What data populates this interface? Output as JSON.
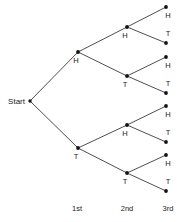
{
  "chart_data": {
    "type": "diagram",
    "diagram_type": "probability-tree",
    "title": "",
    "xlabel": "",
    "ylabel": "",
    "start_label": "Start",
    "stage_labels": [
      "1st",
      "2nd",
      "3rd"
    ],
    "outcome_symbols": [
      "H",
      "T"
    ],
    "nodes": [
      {
        "id": "start",
        "label": "Start",
        "stage": 0,
        "x": 30,
        "y": 101,
        "label_x": 25,
        "label_y": 104,
        "label_anchor": "end"
      },
      {
        "id": "h",
        "label": "H",
        "stage": 1,
        "x": 78,
        "y": 52,
        "label_x": 76,
        "label_y": 63,
        "label_anchor": "middle"
      },
      {
        "id": "t",
        "label": "T",
        "stage": 1,
        "x": 78,
        "y": 148,
        "label_x": 76,
        "label_y": 159,
        "label_anchor": "middle"
      },
      {
        "id": "hh",
        "label": "H",
        "stage": 2,
        "x": 127,
        "y": 27,
        "label_x": 125,
        "label_y": 38,
        "label_anchor": "middle"
      },
      {
        "id": "ht",
        "label": "T",
        "stage": 2,
        "x": 127,
        "y": 76,
        "label_x": 125,
        "label_y": 87,
        "label_anchor": "middle"
      },
      {
        "id": "th",
        "label": "H",
        "stage": 2,
        "x": 127,
        "y": 125,
        "label_x": 125,
        "label_y": 136,
        "label_anchor": "middle"
      },
      {
        "id": "tt",
        "label": "T",
        "stage": 2,
        "x": 127,
        "y": 173,
        "label_x": 125,
        "label_y": 184,
        "label_anchor": "middle"
      },
      {
        "id": "hhh",
        "label": "H",
        "stage": 3,
        "x": 166,
        "y": 7,
        "label_x": 168,
        "label_y": 18,
        "label_anchor": "middle"
      },
      {
        "id": "hht",
        "label": "T",
        "stage": 3,
        "x": 166,
        "y": 43,
        "label_x": 168,
        "label_y": 36,
        "label_anchor": "middle"
      },
      {
        "id": "hth",
        "label": "H",
        "stage": 3,
        "x": 166,
        "y": 57,
        "label_x": 168,
        "label_y": 68,
        "label_anchor": "middle"
      },
      {
        "id": "htt",
        "label": "T",
        "stage": 3,
        "x": 166,
        "y": 93,
        "label_x": 168,
        "label_y": 86,
        "label_anchor": "middle"
      },
      {
        "id": "thh",
        "label": "H",
        "stage": 3,
        "x": 166,
        "y": 106,
        "label_x": 168,
        "label_y": 117,
        "label_anchor": "middle"
      },
      {
        "id": "tht",
        "label": "T",
        "stage": 3,
        "x": 166,
        "y": 142,
        "label_x": 168,
        "label_y": 135,
        "label_anchor": "middle"
      },
      {
        "id": "tth",
        "label": "H",
        "stage": 3,
        "x": 166,
        "y": 155,
        "label_x": 168,
        "label_y": 166,
        "label_anchor": "middle"
      },
      {
        "id": "ttt",
        "label": "T",
        "stage": 3,
        "x": 166,
        "y": 191,
        "label_x": 168,
        "label_y": 184,
        "label_anchor": "middle"
      }
    ],
    "edges": [
      {
        "from": "start",
        "to": "h",
        "x1": 30,
        "y1": 101,
        "x2": 78,
        "y2": 52
      },
      {
        "from": "start",
        "to": "t",
        "x1": 30,
        "y1": 101,
        "x2": 78,
        "y2": 148
      },
      {
        "from": "h",
        "to": "hh",
        "x1": 78,
        "y1": 52,
        "x2": 127,
        "y2": 27
      },
      {
        "from": "h",
        "to": "ht",
        "x1": 78,
        "y1": 52,
        "x2": 127,
        "y2": 76
      },
      {
        "from": "t",
        "to": "th",
        "x1": 78,
        "y1": 148,
        "x2": 127,
        "y2": 125
      },
      {
        "from": "t",
        "to": "tt",
        "x1": 78,
        "y1": 148,
        "x2": 127,
        "y2": 173
      },
      {
        "from": "hh",
        "to": "hhh",
        "x1": 127,
        "y1": 27,
        "x2": 166,
        "y2": 7
      },
      {
        "from": "hh",
        "to": "hht",
        "x1": 127,
        "y1": 27,
        "x2": 166,
        "y2": 43
      },
      {
        "from": "ht",
        "to": "hth",
        "x1": 127,
        "y1": 76,
        "x2": 166,
        "y2": 57
      },
      {
        "from": "ht",
        "to": "htt",
        "x1": 127,
        "y1": 76,
        "x2": 166,
        "y2": 93
      },
      {
        "from": "th",
        "to": "thh",
        "x1": 127,
        "y1": 125,
        "x2": 166,
        "y2": 106
      },
      {
        "from": "th",
        "to": "tht",
        "x1": 127,
        "y1": 125,
        "x2": 166,
        "y2": 142
      },
      {
        "from": "tt",
        "to": "tth",
        "x1": 127,
        "y1": 173,
        "x2": 166,
        "y2": 155
      },
      {
        "from": "tt",
        "to": "ttt",
        "x1": 127,
        "y1": 173,
        "x2": 166,
        "y2": 191
      }
    ],
    "axis_ticks": [
      {
        "label": "1st",
        "x": 77,
        "y": 211
      },
      {
        "label": "2nd",
        "x": 127,
        "y": 211
      },
      {
        "label": "3rd",
        "x": 168,
        "y": 211
      }
    ],
    "colors": {
      "line": "#3a3a3a",
      "node": "#141414",
      "text": "#1a1a1a",
      "background": "#ffffff"
    }
  }
}
